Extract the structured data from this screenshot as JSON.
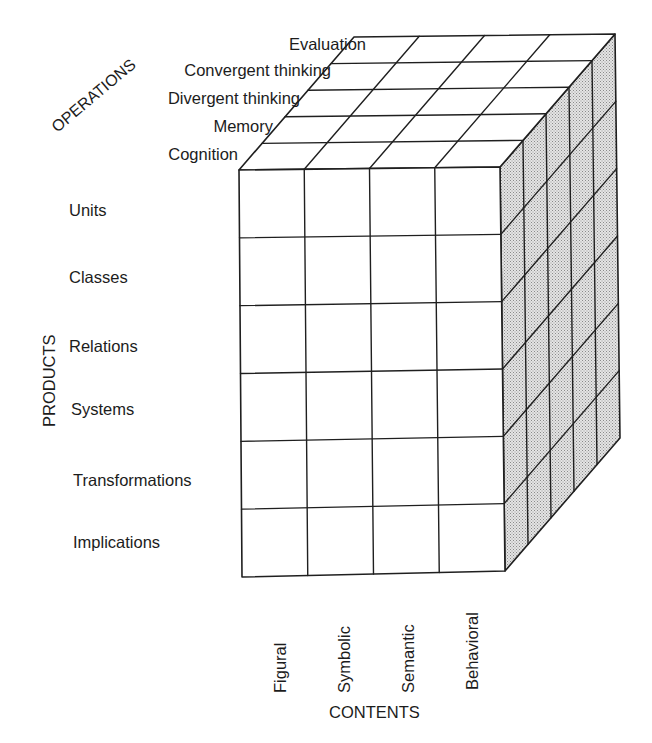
{
  "diagram": {
    "type": "structure-of-intellect-cube",
    "colors": {
      "line": "#1f1f1f",
      "shade": "#cfcfcf",
      "face": "#ffffff"
    },
    "axes": {
      "operations": {
        "title": "OPERATIONS",
        "items": [
          "Cognition",
          "Memory",
          "Divergent thinking",
          "Convergent thinking",
          "Evaluation"
        ]
      },
      "products": {
        "title": "PRODUCTS",
        "items": [
          "Units",
          "Classes",
          "Relations",
          "Systems",
          "Transformations",
          "Implications"
        ]
      },
      "contents": {
        "title": "CONTENTS",
        "items": [
          "Figural",
          "Symbolic",
          "Semantic",
          "Behavioral"
        ]
      }
    }
  }
}
